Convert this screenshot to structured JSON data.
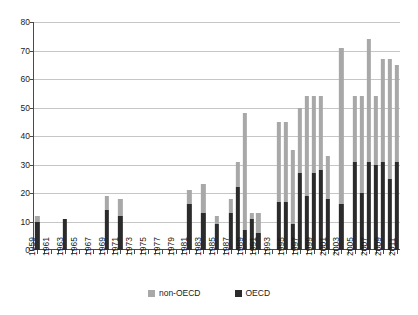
{
  "chart_data": {
    "type": "bar",
    "stacked": true,
    "title": "",
    "subtitle": "",
    "xlabel": "",
    "ylabel": "",
    "ylim": [
      0,
      80
    ],
    "ytick_step": 10,
    "yticks": [
      "0",
      "10",
      "20",
      "30",
      "40",
      "50",
      "60",
      "70",
      "80"
    ],
    "grid": true,
    "legend_position": "bottom-center",
    "legend": [
      "non-OECD",
      "OECD"
    ],
    "colors": {
      "non_oecd": "#a8a8a8",
      "oecd": "#2b2b2b",
      "grid": "#c6c6c6",
      "axis": "#4a4a4a"
    },
    "categories": [
      "1959",
      "1960",
      "1961",
      "1962",
      "1963",
      "1964",
      "1965",
      "1966",
      "1967",
      "1968",
      "1969",
      "1970",
      "1971",
      "1972",
      "1973",
      "1974",
      "1975",
      "1976",
      "1977",
      "1978",
      "1979",
      "1980",
      "1981",
      "1982",
      "1983",
      "1984",
      "1985",
      "1986",
      "1987",
      "1988",
      "1989",
      "1990",
      "1991",
      "1992",
      "1993",
      "1994",
      "1995",
      "1996",
      "1997",
      "1998",
      "1999",
      "2000",
      "2001",
      "2002",
      "2003",
      "2004",
      "2005",
      "2006",
      "2007",
      "2008",
      "2009",
      "2010",
      "2011"
    ],
    "tick_labels": [
      "1959",
      "",
      "1961",
      "",
      "1963",
      "",
      "1965",
      "",
      "1967",
      "",
      "1969",
      "",
      "1971",
      "",
      "1973",
      "",
      "1975",
      "",
      "1977",
      "",
      "1979",
      "",
      "1981",
      "",
      "1983",
      "",
      "1985",
      "",
      "1987",
      "",
      "1989",
      "",
      "1991",
      "",
      "1993",
      "",
      "1995",
      "",
      "1997",
      "",
      "1999",
      "",
      "2001",
      "",
      "2003",
      "",
      "2005",
      "",
      "2007",
      "",
      "2009",
      "",
      "2011"
    ],
    "series": [
      {
        "name": "OECD",
        "color": "#2b2b2b",
        "values": [
          10,
          0,
          0,
          0,
          11,
          0,
          0,
          0,
          0,
          0,
          14,
          0,
          12,
          0,
          0,
          0,
          0,
          0,
          0,
          0,
          0,
          0,
          16,
          0,
          13,
          0,
          9,
          0,
          13,
          22,
          7,
          11,
          6,
          0,
          0,
          17,
          17,
          9,
          27,
          19,
          27,
          28,
          18,
          0,
          16,
          0,
          31,
          20,
          31,
          30,
          31,
          25,
          31
        ]
      },
      {
        "name": "non-OECD",
        "color": "#a8a8a8",
        "values": [
          2,
          0,
          0,
          0,
          0,
          0,
          0,
          0,
          0,
          0,
          5,
          0,
          6,
          0,
          0,
          0,
          0,
          0,
          0,
          0,
          0,
          0,
          5,
          0,
          10,
          0,
          3,
          0,
          5,
          9,
          41,
          2,
          7,
          0,
          0,
          28,
          28,
          26,
          23,
          35,
          27,
          26,
          15,
          0,
          55,
          0,
          23,
          34,
          43,
          24,
          36,
          42,
          34
        ]
      }
    ],
    "totals": [
      12,
      0,
      0,
      0,
      11,
      0,
      0,
      0,
      0,
      0,
      19,
      0,
      18,
      0,
      0,
      0,
      0,
      0,
      0,
      0,
      0,
      0,
      21,
      0,
      23,
      0,
      12,
      0,
      18,
      31,
      48,
      13,
      13,
      45,
      45,
      45,
      45,
      35,
      50,
      54,
      54,
      54,
      33,
      0,
      71,
      0,
      54,
      54,
      74,
      54,
      67,
      67,
      65
    ]
  }
}
